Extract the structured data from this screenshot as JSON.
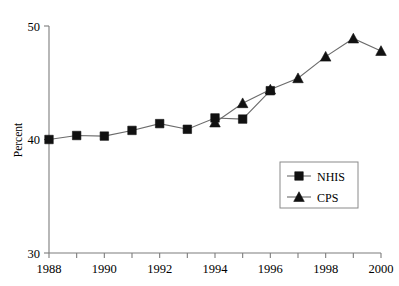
{
  "chart_data": {
    "type": "line",
    "title": "",
    "xlabel": "",
    "ylabel": "Percent",
    "x": [
      1988,
      1989,
      1990,
      1991,
      1992,
      1993,
      1994,
      1995,
      1996,
      1997,
      1998,
      1999,
      2000
    ],
    "xlim": [
      1988,
      2000
    ],
    "ylim": [
      30,
      50
    ],
    "ytick_labels": [
      "50",
      "40",
      "30"
    ],
    "ytick_values": [
      50,
      40,
      30
    ],
    "xtick_labels": [
      "1988",
      "1990",
      "1992",
      "1994",
      "1996",
      "1998",
      "2000"
    ],
    "xtick_values": [
      1988,
      1990,
      1992,
      1994,
      1996,
      1998,
      2000
    ],
    "minor_xticks": [
      1989,
      1991,
      1993,
      1995,
      1997,
      1999
    ],
    "grid": false,
    "legend_position": "center-right",
    "series": [
      {
        "name": "NHIS",
        "marker": "square",
        "color": "#111111",
        "x": [
          1988,
          1989,
          1990,
          1991,
          1992,
          1993,
          1994,
          1995,
          1996
        ],
        "values": [
          40.0,
          40.35,
          40.3,
          40.8,
          41.4,
          40.9,
          41.9,
          41.8,
          44.3
        ]
      },
      {
        "name": "CPS",
        "marker": "triangle",
        "color": "#111111",
        "x": [
          1994,
          1995,
          1996,
          1997,
          1998,
          1999,
          2000
        ],
        "values": [
          41.5,
          43.2,
          44.4,
          45.4,
          47.3,
          48.9,
          47.8
        ]
      }
    ]
  },
  "legend": {
    "entries": [
      {
        "label": "NHIS"
      },
      {
        "label": "CPS"
      }
    ]
  },
  "axes": {
    "y_title": "Percent"
  }
}
